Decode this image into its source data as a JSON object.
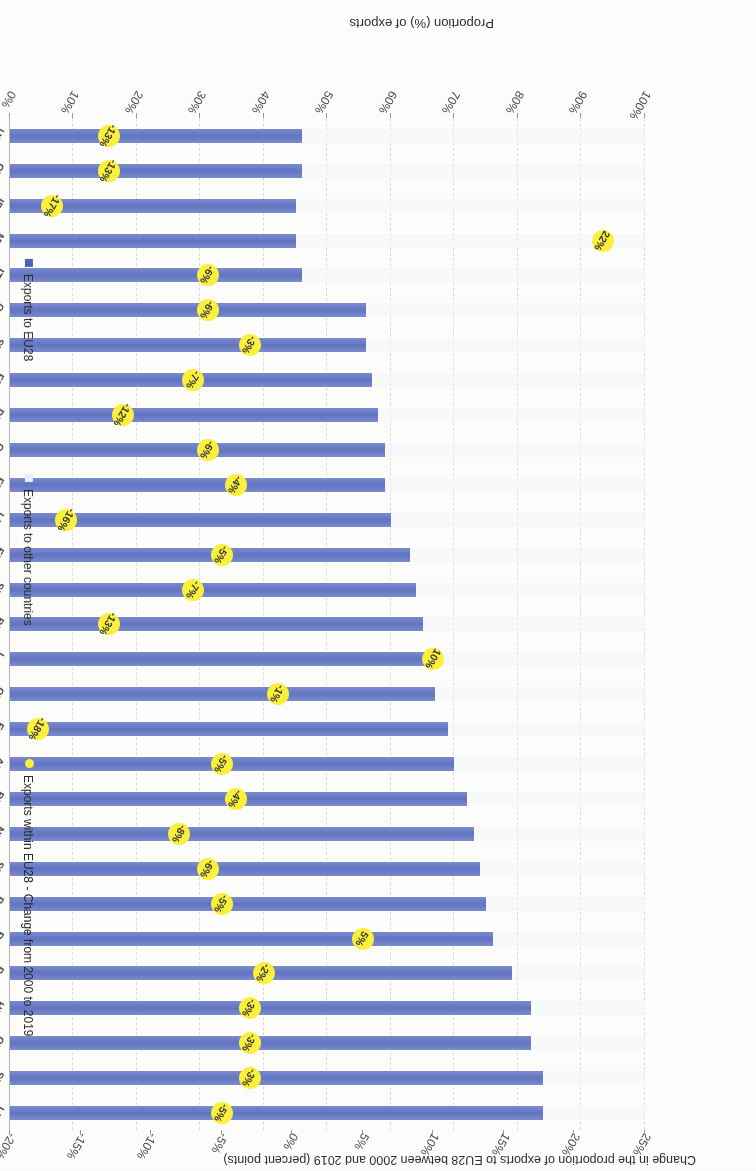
{
  "top_axis_title": "Change in the proportion of exports to EU28 between 2000 and 2019 (percent points)",
  "bottom_axis_title": "Proportion (%) of exports",
  "legend": [
    {
      "label": "Exports to EU28",
      "marker": "blue-square",
      "color": "#4f62b8"
    },
    {
      "label": "Exports to other countries",
      "marker": "light-square",
      "color": "#e9eef7"
    },
    {
      "label": "Exports within EU28 - Change from 2000 to 2019",
      "marker": "yellow-dot",
      "color": "#fbf03c"
    }
  ],
  "chart_data": {
    "type": "bar",
    "xlabel": "Proportion (%) of exports",
    "ylabel": "",
    "secondary_xlabel": "Change in the proportion of exports to EU28 between 2000 and 2019 (percent points)",
    "xlim": [
      0,
      100
    ],
    "xticks": [
      "0%",
      "10%",
      "20%",
      "30%",
      "40%",
      "50%",
      "60%",
      "70%",
      "80%",
      "90%",
      "100%"
    ],
    "secondary_xlim": [
      -20,
      25
    ],
    "secondary_xticks": [
      "-20%",
      "-15%",
      "-10%",
      "-5%",
      "0%",
      "5%",
      "10%",
      "15%",
      "20%",
      "25%"
    ],
    "grid": true,
    "legend_position": "bottom-right",
    "categories": [
      "LUXEMBOURG",
      "SLOVAKIA",
      "CZECHIA",
      "HUNGARY",
      "POLAND",
      "ROMANIA",
      "PORTUGAL",
      "SLOVENIA",
      "NETHERLANDS",
      "BELGIUM",
      "AUSTRIA",
      "ESTONIA",
      "CROATIA",
      "LATVIA",
      "BULGARIA",
      "SPAIN",
      "EU28",
      "LITHUANIA",
      "FINLAND",
      "GERMANY",
      "DENMARK",
      "FRANCE",
      "SWEDEN",
      "GREECE",
      "ITALY",
      "MALTA",
      "IRELAND",
      "CYPRUS",
      "UNITED KINGDOM"
    ],
    "series": [
      {
        "name": "Exports to EU28",
        "unit": "%",
        "values": [
          84,
          84,
          82,
          82,
          79,
          76,
          75,
          74,
          73,
          72,
          70,
          69,
          67,
          66,
          65,
          64,
          63,
          60,
          59,
          59,
          58,
          57,
          56,
          56,
          46,
          45,
          45,
          46,
          46
        ]
      },
      {
        "name": "Exports within EU28 - Change from 2000 to 2019",
        "unit": "percent points",
        "values": [
          -5,
          -3,
          -3,
          -3,
          -2,
          5,
          -5,
          -6,
          -8,
          -4,
          -5,
          -18,
          -1,
          10,
          -13,
          -7,
          -5,
          -16,
          -4,
          -6,
          -12,
          -7,
          -3,
          -6,
          -6,
          22,
          -17,
          -13,
          -13
        ],
        "labels": [
          "-5%",
          "-3%",
          "-3%",
          "-3%",
          "-2%",
          "5%",
          "-5%",
          "-6%",
          "-8%",
          "-4%",
          "-5%",
          "-18%",
          "-1%",
          "10%",
          "-13%",
          "-7%",
          "-5%",
          "-16%",
          "-4%",
          "-6%",
          "-12%",
          "-7%",
          "-3%",
          "-6%",
          "-6%",
          "22%",
          "-17%",
          "-13%",
          "-13%"
        ]
      }
    ]
  }
}
